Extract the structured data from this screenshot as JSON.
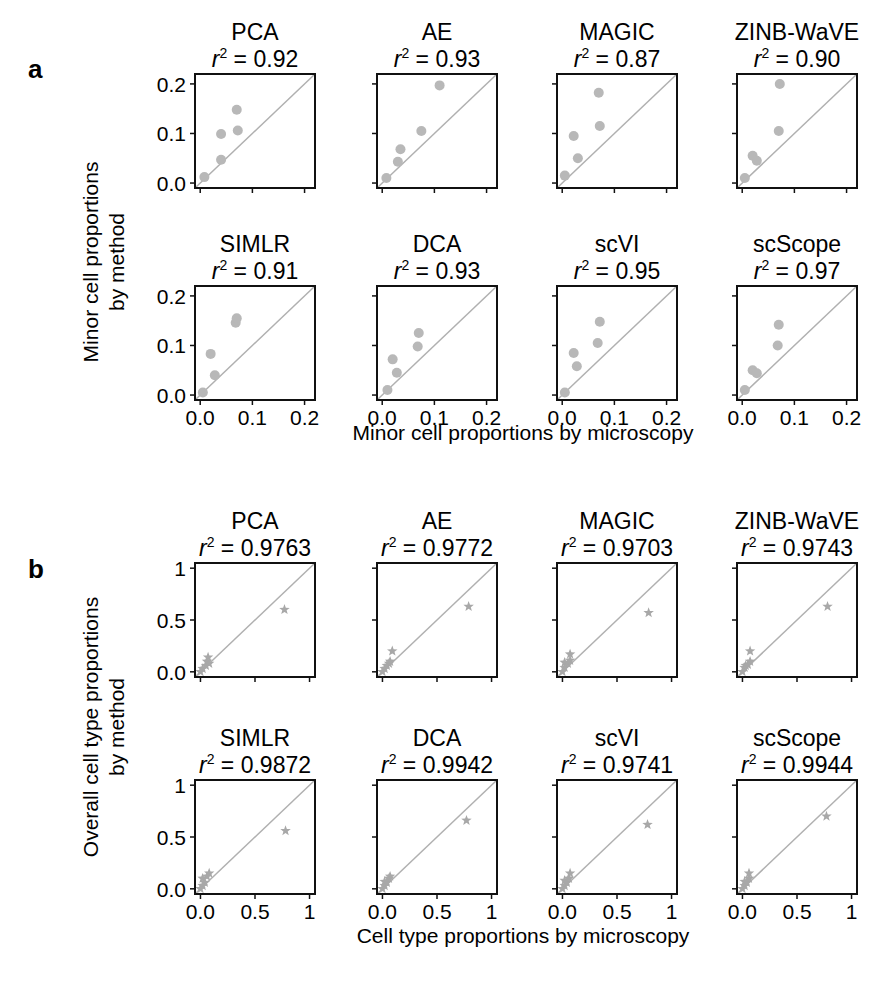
{
  "figure": {
    "panel_a": {
      "letter": "a",
      "ylabel_line1": "Minor cell proportions",
      "ylabel_line2": "by method",
      "xlabel": "Minor cell proportions  by microscopy",
      "marker": "circle",
      "marker_color": "#b8b8b8",
      "line_color": "#b0b0b0"
    },
    "panel_b": {
      "letter": "b",
      "ylabel_line1": "Overall cell type proportions",
      "ylabel_line2": "by method",
      "xlabel": "Cell type proportions by microscopy",
      "marker": "star",
      "marker_color": "#a8a8a8",
      "line_color": "#b0b0b0"
    }
  },
  "chart_data": [
    {
      "type": "scatter",
      "panel": "a",
      "xlabel": "Minor cell proportions  by microscopy",
      "ylabel": "Minor cell proportions by method",
      "xlim": [
        -0.01,
        0.22
      ],
      "ylim": [
        -0.01,
        0.22
      ],
      "xticks": [
        "0.0",
        "0.1",
        "0.2"
      ],
      "yticks": [
        "0.0",
        "0.1",
        "0.2"
      ],
      "reference_line": "y = x",
      "subplots": [
        {
          "title": "PCA",
          "r2": "0.92",
          "points": [
            [
              0.008,
              0.012
            ],
            [
              0.04,
              0.047
            ],
            [
              0.04,
              0.099
            ],
            [
              0.07,
              0.148
            ],
            [
              0.072,
              0.106
            ]
          ]
        },
        {
          "title": "AE",
          "r2": "0.93",
          "points": [
            [
              0.008,
              0.01
            ],
            [
              0.03,
              0.043
            ],
            [
              0.035,
              0.068
            ],
            [
              0.075,
              0.105
            ],
            [
              0.11,
              0.197
            ]
          ]
        },
        {
          "title": "MAGIC",
          "r2": "0.87",
          "points": [
            [
              0.005,
              0.015
            ],
            [
              0.03,
              0.05
            ],
            [
              0.022,
              0.095
            ],
            [
              0.072,
              0.115
            ],
            [
              0.07,
              0.182
            ]
          ]
        },
        {
          "title": "ZINB-WaVE",
          "r2": "0.90",
          "points": [
            [
              0.005,
              0.01
            ],
            [
              0.02,
              0.055
            ],
            [
              0.028,
              0.045
            ],
            [
              0.07,
              0.105
            ],
            [
              0.072,
              0.2
            ]
          ]
        },
        {
          "title": "SIMLR",
          "r2": "0.91",
          "points": [
            [
              0.005,
              0.005
            ],
            [
              0.028,
              0.04
            ],
            [
              0.02,
              0.083
            ],
            [
              0.068,
              0.146
            ],
            [
              0.07,
              0.155
            ]
          ]
        },
        {
          "title": "DCA",
          "r2": "0.93",
          "points": [
            [
              0.01,
              0.01
            ],
            [
              0.028,
              0.045
            ],
            [
              0.02,
              0.072
            ],
            [
              0.068,
              0.098
            ],
            [
              0.07,
              0.125
            ]
          ]
        },
        {
          "title": "scVI",
          "r2": "0.95",
          "points": [
            [
              0.005,
              0.005
            ],
            [
              0.028,
              0.058
            ],
            [
              0.022,
              0.085
            ],
            [
              0.068,
              0.105
            ],
            [
              0.072,
              0.148
            ]
          ]
        },
        {
          "title": "scScope",
          "r2": "0.97",
          "points": [
            [
              0.005,
              0.01
            ],
            [
              0.02,
              0.05
            ],
            [
              0.028,
              0.044
            ],
            [
              0.068,
              0.1
            ],
            [
              0.07,
              0.142
            ]
          ]
        }
      ]
    },
    {
      "type": "scatter",
      "panel": "b",
      "xlabel": "Cell type proportions by microscopy",
      "ylabel": "Overall cell type proportions by method",
      "xlim": [
        -0.05,
        1.05
      ],
      "ylim": [
        -0.05,
        1.05
      ],
      "xticks": [
        "0.0",
        "0.5",
        "1"
      ],
      "yticks": [
        "0.0",
        "0.5",
        "1"
      ],
      "reference_line": "y = x",
      "subplots": [
        {
          "title": "PCA",
          "r2": "0.9763",
          "points": [
            [
              0.0,
              0.0
            ],
            [
              0.02,
              0.03
            ],
            [
              0.05,
              0.06
            ],
            [
              0.06,
              0.1
            ],
            [
              0.07,
              0.14
            ],
            [
              0.08,
              0.08
            ],
            [
              0.77,
              0.6
            ]
          ]
        },
        {
          "title": "AE",
          "r2": "0.9772",
          "points": [
            [
              0.0,
              0.0
            ],
            [
              0.02,
              0.03
            ],
            [
              0.04,
              0.06
            ],
            [
              0.06,
              0.08
            ],
            [
              0.07,
              0.1
            ],
            [
              0.09,
              0.2
            ],
            [
              0.79,
              0.63
            ]
          ]
        },
        {
          "title": "MAGIC",
          "r2": "0.9703",
          "points": [
            [
              0.0,
              0.0
            ],
            [
              0.02,
              0.04
            ],
            [
              0.02,
              0.09
            ],
            [
              0.05,
              0.08
            ],
            [
              0.07,
              0.11
            ],
            [
              0.07,
              0.17
            ],
            [
              0.79,
              0.57
            ]
          ]
        },
        {
          "title": "ZINB-WaVE",
          "r2": "0.9743",
          "points": [
            [
              0.0,
              0.0
            ],
            [
              0.02,
              0.04
            ],
            [
              0.03,
              0.06
            ],
            [
              0.05,
              0.07
            ],
            [
              0.07,
              0.1
            ],
            [
              0.07,
              0.2
            ],
            [
              0.78,
              0.63
            ]
          ]
        },
        {
          "title": "SIMLR",
          "r2": "0.9872",
          "points": [
            [
              0.0,
              0.0
            ],
            [
              0.02,
              0.03
            ],
            [
              0.02,
              0.1
            ],
            [
              0.04,
              0.06
            ],
            [
              0.06,
              0.12
            ],
            [
              0.08,
              0.15
            ],
            [
              0.78,
              0.56
            ]
          ]
        },
        {
          "title": "DCA",
          "r2": "0.9942",
          "points": [
            [
              0.0,
              0.0
            ],
            [
              0.02,
              0.03
            ],
            [
              0.02,
              0.07
            ],
            [
              0.04,
              0.06
            ],
            [
              0.06,
              0.1
            ],
            [
              0.07,
              0.12
            ],
            [
              0.77,
              0.66
            ]
          ]
        },
        {
          "title": "scVI",
          "r2": "0.9741",
          "points": [
            [
              0.0,
              0.0
            ],
            [
              0.02,
              0.03
            ],
            [
              0.02,
              0.08
            ],
            [
              0.04,
              0.06
            ],
            [
              0.06,
              0.1
            ],
            [
              0.07,
              0.15
            ],
            [
              0.78,
              0.62
            ]
          ]
        },
        {
          "title": "scScope",
          "r2": "0.9944",
          "points": [
            [
              0.0,
              0.0
            ],
            [
              0.02,
              0.03
            ],
            [
              0.02,
              0.07
            ],
            [
              0.04,
              0.06
            ],
            [
              0.06,
              0.1
            ],
            [
              0.06,
              0.15
            ],
            [
              0.77,
              0.7
            ]
          ]
        }
      ]
    }
  ]
}
